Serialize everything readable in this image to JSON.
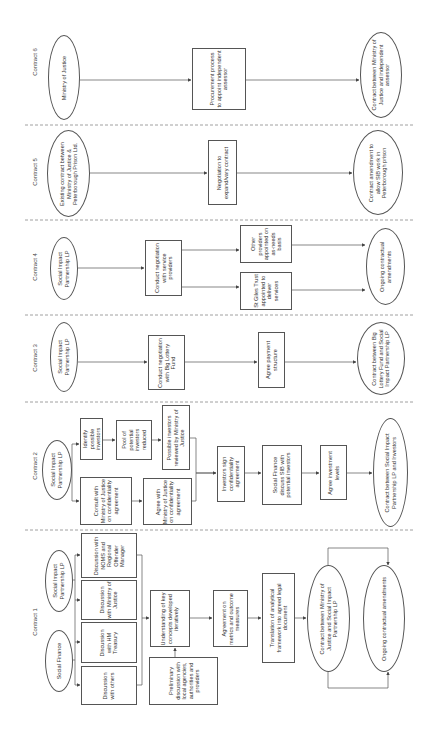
{
  "lanes": [
    {
      "label": "Contract 6",
      "y": 62
    },
    {
      "label": "Contract 5",
      "y": 172
    },
    {
      "label": "Contract 4",
      "y": 267
    },
    {
      "label": "Contract 3",
      "y": 358
    },
    {
      "label": "Contract 2",
      "y": 466
    },
    {
      "label": "Contract 1",
      "y": 622
    }
  ],
  "dividers_y": [
    125,
    220,
    315,
    402,
    530
  ],
  "nodes": {
    "c6_start": "Ministry of Justice",
    "c6_proc": "Procurement process to appoint independent assessor",
    "c6_end": "Contract between Ministry of Justice and independent assessor",
    "c5_start": "Existing contract between Ministry of Justice & Peterborough Prison Ltd.",
    "c5_neg": "Negotiation to expand/vary contract",
    "c5_end": "Contract amendment to allow SIB work in Peterborough prison",
    "c4_start": "Social Impact Partnership LP",
    "c4_neg": "Conduct negotiation with service providers",
    "c4_other": "Other providers appointed on as-needs basis",
    "c4_stgiles": "St Giles Trust appointed to deliver services",
    "c4_end": "Ongoing contractual amendments",
    "c3_start": "Social Impact Partnership LP",
    "c3_neg": "Conduct negotiation with Big Lottery Fund",
    "c3_pay": "Agree payment structure",
    "c3_end": "Contract between Big Lottery Fund and Social Impact Partnership LP",
    "c2_start": "Social Impact Partnership LP",
    "c2_identify": "Identify possible investors",
    "c2_pool": "Pool of potential investors reduced",
    "c2_reviewed": "Possible investors reviewed by Ministry of Justice",
    "c2_consult": "Consult with Ministry of Justice on confidentiality agreement",
    "c2_agree": "Agree with Ministry of Justice on confidentiality agreement",
    "c2_sign": "Investors sign confidentiality agreement",
    "c2_sf": "Social Finance discuss SIB with potential investors",
    "c2_levels": "Agree investment levels",
    "c2_end": "Contract between Social Impact Partnership LP and Investors",
    "c1_sip": "Social Impact Partnership LP",
    "c1_sf": "Social Finance",
    "c1_noms": "Discussion with NOMS and Regional Offender Manager",
    "c1_moj": "Discussion with Ministry of Justice",
    "c1_hmt": "Discussion with HM Treasury",
    "c1_others": "Discussion with others",
    "c1_understanding": "Understanding of key concepts developed iteratively",
    "c1_prelim": "Preliminary discussion with local agencies, authorities and providers",
    "c1_metrics": "Agreement on metrics and outcome measures",
    "c1_translation": "Translation of analytical framework into agreed legal document",
    "c1_contract": "Contract between Ministry of Justice and Social Impact Partnership LP",
    "c1_ongoing": "Ongoing contractual amendments"
  },
  "colors": {
    "line": "#555555",
    "divider": "#888888",
    "text": "#333333"
  }
}
